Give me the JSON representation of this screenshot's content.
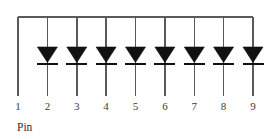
{
  "diagram": {
    "caption": "Pin",
    "colors": {
      "wire": "#5a5a5a",
      "diode": "#111111",
      "label": "#3a3a3a",
      "background": "#ffffff"
    },
    "bus": {
      "name": "common-bus-line",
      "orientation": "horizontal",
      "y": 17,
      "x_start": 18,
      "x_end": 253
    },
    "geometry": {
      "pin_spacing": 29.4,
      "first_pin_x": 18,
      "line_top_y": 17,
      "line_bottom_y": 96,
      "diode_top_y": 47,
      "diode_bar_y": 64,
      "triangle_half_width": 10,
      "bar_half_width": 10.5
    },
    "pins": [
      {
        "number": "1",
        "x": 18,
        "has_diode": false,
        "diode_label": ""
      },
      {
        "number": "2",
        "x": 47.4,
        "has_diode": true,
        "diode_label": "D1"
      },
      {
        "number": "3",
        "x": 76.8,
        "has_diode": true,
        "diode_label": "D2"
      },
      {
        "number": "4",
        "x": 106.1,
        "has_diode": true,
        "diode_label": "D3"
      },
      {
        "number": "5",
        "x": 135.5,
        "has_diode": true,
        "diode_label": "D4"
      },
      {
        "number": "6",
        "x": 164.9,
        "has_diode": true,
        "diode_label": "D5"
      },
      {
        "number": "7",
        "x": 194.3,
        "has_diode": true,
        "diode_label": "D6"
      },
      {
        "number": "8",
        "x": 223.6,
        "has_diode": true,
        "diode_label": "D7"
      },
      {
        "number": "9",
        "x": 253,
        "has_diode": true,
        "diode_label": "D8"
      }
    ],
    "pin_label_y": 100,
    "caption_x": 17,
    "caption_y": 121
  }
}
